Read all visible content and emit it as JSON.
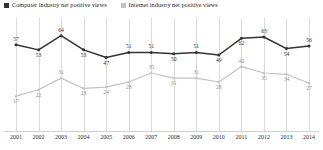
{
  "legend": {
    "items": [
      {
        "label": "Computer industry net positive views",
        "color": "#333333",
        "key": "computer"
      },
      {
        "label": "Internet industry net positive views",
        "color": "#c3c3c3",
        "key": "internet"
      }
    ]
  },
  "chart_data": {
    "type": "line",
    "title": "",
    "xlabel": "",
    "ylabel": "",
    "ylim": [
      0,
      70
    ],
    "grid": true,
    "legend_position": "top-left",
    "categories": [
      "2001",
      "2002",
      "2003",
      "2004",
      "2005",
      "2006",
      "2007",
      "2008",
      "2009",
      "2010",
      "2011",
      "2012",
      "2013",
      "2014"
    ],
    "series": [
      {
        "name": "Computer industry net positive views",
        "color": "#333333",
        "values": [
          57,
          53,
          64,
          53,
          47,
          51,
          51,
          50,
          51,
          49,
          62,
          63,
          54,
          56
        ]
      },
      {
        "name": "Internet industry net positive views",
        "color": "#c3c3c3",
        "values": [
          17,
          22,
          31,
          23,
          24,
          28,
          35,
          31,
          31,
          28,
          40,
          35,
          34,
          27
        ]
      }
    ]
  }
}
